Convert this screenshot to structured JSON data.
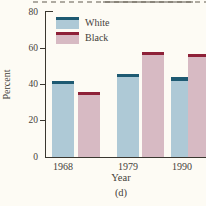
{
  "chart_data": {
    "type": "bar",
    "title": "",
    "categories": [
      "1968",
      "1979",
      "1990"
    ],
    "series": [
      {
        "name": "White",
        "values": [
          42,
          46,
          44
        ],
        "fill_color": "#aec9d6",
        "cap_color": "#1e5a72"
      },
      {
        "name": "Black",
        "values": [
          36,
          58,
          57
        ],
        "fill_color": "#d7bac3",
        "cap_color": "#8e2138"
      }
    ],
    "xlabel": "Year",
    "ylabel": "Percent",
    "ylim": [
      0,
      80
    ],
    "yticks": [
      0,
      20,
      40,
      60,
      80
    ],
    "grid": false,
    "legend_position": "upper-left",
    "caption": "(d)"
  },
  "figure": {
    "panel_label": "(d)",
    "background_color": "#fdfbf4",
    "axis_color": "#3a372f",
    "text_color": "#45413a"
  }
}
